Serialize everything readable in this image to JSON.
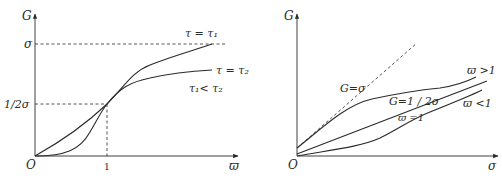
{
  "left_plot": {
    "y_axis_label": "G",
    "x_axis_label": "ϖ",
    "origin_label": "O",
    "y_ticks": [
      {
        "label": "σ"
      },
      {
        "label": "1/2σ"
      }
    ],
    "x_ticks": [
      {
        "label": "1"
      }
    ],
    "curves": [
      {
        "label": "τ = τ₁"
      },
      {
        "label": "τ = τ₂"
      }
    ],
    "annotation": "τ₁< τ₂"
  },
  "right_plot": {
    "y_axis_label": "G",
    "x_axis_label": "σ",
    "origin_label": "O",
    "reference_line_label": "G=σ",
    "curves": [
      {
        "label": "ϖ >1"
      },
      {
        "label": "G=1 / 2σ"
      },
      {
        "label": "ϖ =1"
      },
      {
        "label": "ϖ <1"
      }
    ]
  },
  "colors": {
    "line": "#2a2a2a",
    "background": "#ffffff"
  }
}
